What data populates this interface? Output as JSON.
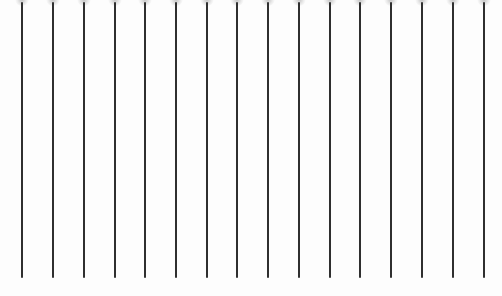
{
  "scene": {
    "description": "Row of vertical dark lines with faint gray heads at top edge",
    "background": "#fdfdfd",
    "line_color": "#2f2f2f",
    "line_count": 16,
    "line_top_y": 2,
    "line_bottom_y": 278,
    "lines_x": [
      22,
      53,
      84,
      115,
      145,
      176,
      207,
      237,
      268,
      299,
      330,
      360,
      391,
      422,
      453,
      484
    ]
  }
}
